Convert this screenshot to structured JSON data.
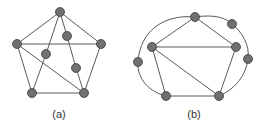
{
  "figure": {
    "panels": [
      {
        "id": "a",
        "caption": "(a)",
        "caption_pos": [
          59,
          108
        ],
        "nodes": [
          {
            "id": "top",
            "x": 60,
            "y": 12
          },
          {
            "id": "left",
            "x": 17,
            "y": 44
          },
          {
            "id": "right",
            "x": 101,
            "y": 44
          },
          {
            "id": "bottom-left",
            "x": 32,
            "y": 93
          },
          {
            "id": "bottom-right",
            "x": 84,
            "y": 93
          },
          {
            "id": "inner-upper",
            "x": 67,
            "y": 36
          },
          {
            "id": "inner-left",
            "x": 46,
            "y": 54
          },
          {
            "id": "inner-lower",
            "x": 76,
            "y": 68
          }
        ],
        "edges": [
          [
            "top",
            "left"
          ],
          [
            "top",
            "right"
          ],
          [
            "left",
            "right"
          ],
          [
            "left",
            "bottom-left"
          ],
          [
            "right",
            "bottom-right"
          ],
          [
            "bottom-left",
            "bottom-right"
          ],
          [
            "left",
            "bottom-right"
          ],
          [
            "top",
            "inner-left"
          ],
          [
            "inner-left",
            "bottom-left"
          ],
          [
            "top",
            "inner-upper"
          ],
          [
            "inner-upper",
            "inner-lower"
          ],
          [
            "inner-lower",
            "bottom-right"
          ]
        ]
      },
      {
        "id": "b",
        "caption": "(b)",
        "caption_pos": [
          194,
          108
        ],
        "nodes": [
          {
            "id": "top",
            "x": 195,
            "y": 17
          },
          {
            "id": "left",
            "x": 152,
            "y": 47
          },
          {
            "id": "right",
            "x": 236,
            "y": 47
          },
          {
            "id": "bottom-left",
            "x": 166,
            "y": 96
          },
          {
            "id": "bottom-right",
            "x": 219,
            "y": 96
          },
          {
            "id": "outer-right-top",
            "x": 232,
            "y": 24
          },
          {
            "id": "outer-right",
            "x": 248,
            "y": 59
          },
          {
            "id": "outer-left",
            "x": 138,
            "y": 62
          }
        ],
        "edges": [
          [
            "top",
            "left"
          ],
          [
            "top",
            "right"
          ],
          [
            "left",
            "right"
          ],
          [
            "left",
            "bottom-left"
          ],
          [
            "right",
            "bottom-right"
          ],
          [
            "bottom-left",
            "bottom-right"
          ],
          [
            "left",
            "bottom-right"
          ]
        ],
        "curves": [
          "M195,17 C215,14 226,18 232,24 C242,32 250,45 248,59 C246,76 234,90 219,96",
          "M195,17 C165,14 140,30 138,62 C137,80 150,92 166,96"
        ]
      }
    ]
  }
}
